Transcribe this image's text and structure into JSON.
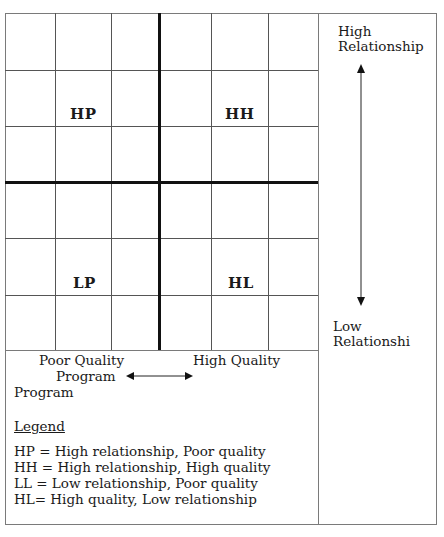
{
  "diagram": {
    "type": "2x2 quadrant matrix",
    "quadrants": [
      {
        "code": "HP",
        "position": "top-left"
      },
      {
        "code": "HH",
        "position": "top-right"
      },
      {
        "code": "LP",
        "position": "bottom-left"
      },
      {
        "code": "HL",
        "position": "bottom-right"
      }
    ],
    "y_axis": {
      "top_label_line1": "High",
      "top_label_line2": "Relationship",
      "bottom_label_line1": "Low",
      "bottom_label_line2": "Relationshi"
    },
    "x_axis": {
      "left_label_line1": "Poor Quality",
      "left_label_line2": "Program",
      "left_label_line3": "Program",
      "right_label": "High Quality"
    },
    "legend": {
      "title": "Legend",
      "items": [
        "HP = High relationship, Poor quality",
        "HH = High relationship, High quality",
        "LL = Low relationship, Poor quality",
        "HL= High quality, Low relationship"
      ]
    },
    "colors": {
      "line": "#555555",
      "axis": "#111111",
      "text": "#1a1a1a"
    }
  }
}
